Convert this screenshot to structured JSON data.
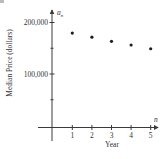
{
  "chart_data": {
    "type": "scatter",
    "title": "",
    "xlabel": "Year",
    "ylabel": "Median Price (dollars)",
    "x_axis_var": "n",
    "y_axis_var": "a",
    "y_axis_var_sub": "n",
    "x": [
      1,
      2,
      3,
      4,
      5
    ],
    "x_tick_labels": [
      "1",
      "2",
      "3",
      "4",
      "5"
    ],
    "y_tick_labels": [
      "100,000",
      "200,000"
    ],
    "y_ticks": [
      100000,
      200000
    ],
    "y_minor_ticks": [
      50000,
      150000
    ],
    "series": [
      {
        "name": "Median Price",
        "values": [
          179500,
          171500,
          163500,
          156300,
          149000
        ]
      }
    ],
    "xlim": [
      -0.7,
      5.5
    ],
    "ylim": [
      -30000,
      230000
    ],
    "grid": false,
    "legend": "none",
    "point_color": "#1e1e1e"
  }
}
